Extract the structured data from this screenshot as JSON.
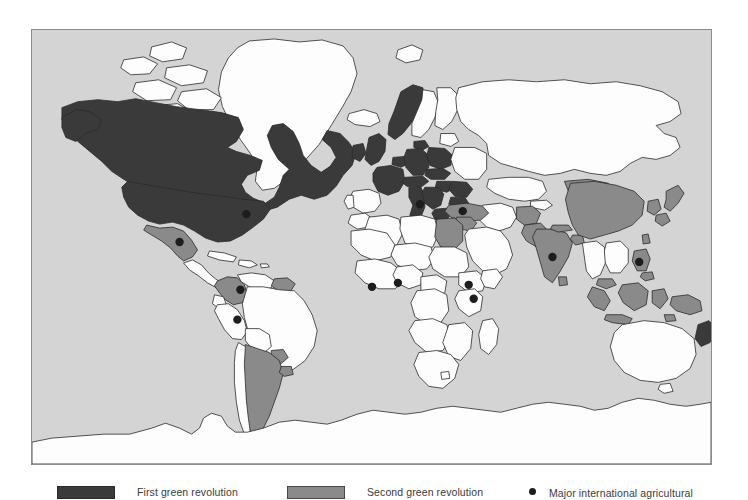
{
  "figure": {
    "kind": "thematic-world-map",
    "background_color": "#ffffff",
    "ocean_color": "#d4d4d4",
    "frame_border_color": "#8d8d8d"
  },
  "map": {
    "name": "world-map",
    "classes": [
      {
        "key": "first",
        "label": "First green revolution",
        "color": "#3a3a3a"
      },
      {
        "key": "second",
        "label": "Second green revolution",
        "color": "#8a8a8a"
      },
      {
        "key": "none",
        "label": "",
        "color": "#fdfdfd"
      }
    ],
    "outline_color": "#2b2b2b",
    "marker": {
      "label": "Major international agricultural research centre",
      "color": "#1d1d1d",
      "radius": 4
    },
    "first_green_revolution_regions": [
      "Canada",
      "United States",
      "United Kingdom",
      "Ireland",
      "France",
      "Germany",
      "Netherlands",
      "Belgium",
      "Denmark",
      "Norway",
      "Switzerland",
      "Austria",
      "Italy",
      "Czechia",
      "Slovakia",
      "Hungary",
      "Poland",
      "Romania",
      "Bulgaria",
      "Greece",
      "Former Yugoslavia",
      "New Zealand"
    ],
    "second_green_revolution_regions": [
      "Mexico",
      "Colombia",
      "Guyana",
      "Suriname",
      "Argentina",
      "Uruguay",
      "Turkey",
      "Syria",
      "Egypt",
      "Pakistan",
      "India",
      "Bangladesh",
      "Sri Lanka",
      "China",
      "Mongolia",
      "North Korea",
      "South Korea",
      "Japan",
      "Taiwan",
      "Afghanistan",
      "Malaysia",
      "Indonesia",
      "Philippines",
      "Papua New Guinea"
    ],
    "research_centre_markers": [
      {
        "name": "centre-usa",
        "x": 215,
        "y": 185
      },
      {
        "name": "centre-mexico",
        "x": 148,
        "y": 213
      },
      {
        "name": "centre-colombia",
        "x": 209,
        "y": 261
      },
      {
        "name": "centre-peru",
        "x": 206,
        "y": 291
      },
      {
        "name": "centre-west-africa",
        "x": 341,
        "y": 258
      },
      {
        "name": "centre-nigeria",
        "x": 367,
        "y": 254
      },
      {
        "name": "centre-ethiopia",
        "x": 438,
        "y": 256
      },
      {
        "name": "centre-kenya",
        "x": 443,
        "y": 270
      },
      {
        "name": "centre-italy",
        "x": 389,
        "y": 175
      },
      {
        "name": "centre-syria",
        "x": 432,
        "y": 182
      },
      {
        "name": "centre-india",
        "x": 522,
        "y": 228
      },
      {
        "name": "centre-philippines",
        "x": 609,
        "y": 233
      }
    ]
  },
  "legend": {
    "title": "",
    "items": [
      {
        "key": "first",
        "label": "First green revolution",
        "symbol": "filled-dark-swatch"
      },
      {
        "key": "second",
        "label": "Second green revolution",
        "symbol": "filled-gray-swatch"
      },
      {
        "key": "centre",
        "label": "Major international agricultural",
        "symbol": "black-dot"
      }
    ]
  }
}
